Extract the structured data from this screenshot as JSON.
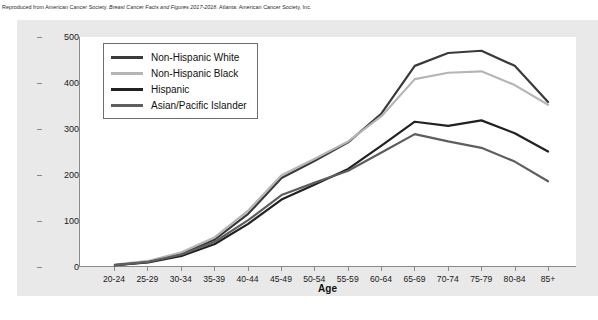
{
  "caption": {
    "prefix": "Reproduced from American Cancer Society. ",
    "italic": "Breast Cancer Facts and Figures 2017-2018",
    "suffix": ". Atlanta: American Cancer Society, Inc."
  },
  "colors": {
    "panel_background": "#e9e9e9",
    "plot_background": "#ffffff",
    "axis": "#8a8a8a",
    "non_hispanic_white": "#3a3a3a",
    "non_hispanic_black": "#b5b5b5",
    "hispanic": "#212121",
    "asian_pacific_islander": "#5e5e5e"
  },
  "legend": {
    "position": "top-left-inside",
    "items": [
      {
        "label": "Non-Hispanic White",
        "color": "#3a3a3a"
      },
      {
        "label": "Non-Hispanic Black",
        "color": "#b5b5b5"
      },
      {
        "label": "Hispanic",
        "color": "#212121"
      },
      {
        "label": "Asian/Pacific Islander",
        "color": "#5e5e5e"
      }
    ]
  },
  "chart_data": {
    "type": "line",
    "title": "",
    "xlabel": "Age",
    "ylabel": "Rate per 100,000",
    "ylim": [
      0,
      500
    ],
    "yticks": [
      0,
      100,
      200,
      300,
      400,
      500
    ],
    "grid": false,
    "categories": [
      "20-24",
      "25-29",
      "30-34",
      "35-39",
      "40-44",
      "45-49",
      "50-54",
      "55-59",
      "60-64",
      "65-69",
      "70-74",
      "75-79",
      "80-84",
      "85+"
    ],
    "series": [
      {
        "name": "Non-Hispanic White",
        "color": "#3a3a3a",
        "values": [
          2,
          9,
          26,
          58,
          114,
          192,
          230,
          270,
          333,
          437,
          465,
          470,
          437,
          358
        ]
      },
      {
        "name": "Non-Hispanic Black",
        "color": "#b5b5b5",
        "values": [
          3,
          11,
          30,
          63,
          121,
          198,
          234,
          272,
          327,
          408,
          422,
          425,
          395,
          352
        ]
      },
      {
        "name": "Hispanic",
        "color": "#212121",
        "values": [
          2,
          8,
          22,
          48,
          92,
          145,
          178,
          212,
          263,
          315,
          306,
          318,
          290,
          250
        ]
      },
      {
        "name": "Asian/Pacific Islander",
        "color": "#5e5e5e",
        "values": [
          2,
          9,
          25,
          53,
          100,
          155,
          182,
          208,
          248,
          288,
          272,
          258,
          228,
          185
        ]
      }
    ]
  }
}
